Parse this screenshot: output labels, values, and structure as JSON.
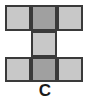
{
  "figure": {
    "label": "C",
    "background_color": "#ffffff",
    "border_color": "#3a3a3a",
    "border_width_px": 2,
    "grid": {
      "columns": 3,
      "rows": 3,
      "cell_size_px": 26,
      "origin_x_px": 5,
      "origin_y_px": 5
    },
    "palette": {
      "light_fill": "#c8c8c8",
      "dark_fill": "#a0a0a0"
    },
    "cells": [
      {
        "id": "r1c1",
        "row": 1,
        "col": 1,
        "fill": "light",
        "present": true
      },
      {
        "id": "r1c2",
        "row": 1,
        "col": 2,
        "fill": "dark",
        "present": true
      },
      {
        "id": "r1c3",
        "row": 1,
        "col": 3,
        "fill": "light",
        "present": true
      },
      {
        "id": "r2c1",
        "row": 2,
        "col": 1,
        "fill": "none",
        "present": false
      },
      {
        "id": "r2c2",
        "row": 2,
        "col": 2,
        "fill": "light",
        "present": true
      },
      {
        "id": "r2c3",
        "row": 2,
        "col": 3,
        "fill": "none",
        "present": false
      },
      {
        "id": "r3c1",
        "row": 3,
        "col": 1,
        "fill": "light",
        "present": true
      },
      {
        "id": "r3c2",
        "row": 3,
        "col": 2,
        "fill": "dark",
        "present": true
      },
      {
        "id": "r3c3",
        "row": 3,
        "col": 3,
        "fill": "light",
        "present": true
      }
    ]
  }
}
